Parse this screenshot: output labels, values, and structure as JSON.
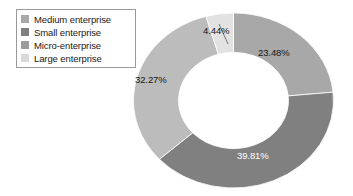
{
  "chart_data": {
    "type": "pie",
    "variant": "donut",
    "title": "",
    "subtitle": "",
    "xlabel": "",
    "ylabel": "",
    "grid": false,
    "legend_position": "top-left",
    "units": "percent",
    "start_angle_deg": 0,
    "direction": "clockwise",
    "inner_radius_ratio": 0.55,
    "categories": [
      "Medium enterprise",
      "Small enterprise",
      "Micro-enterprise",
      "Large enterprise"
    ],
    "values": [
      23.48,
      39.81,
      32.27,
      4.44
    ],
    "labels": [
      "23.48%",
      "39.81%",
      "32.27%",
      "4.44%"
    ],
    "colors": [
      "#a8a8a8",
      "#808080",
      "#bcbcbc",
      "#e2e2e2"
    ],
    "slices": [
      {
        "name": "Medium enterprise",
        "value": 23.48,
        "label": "23.48%",
        "color": "#a8a8a8",
        "label_color": "dark",
        "label_placement": "outside-right"
      },
      {
        "name": "Small enterprise",
        "value": 39.81,
        "label": "39.81%",
        "color": "#808080",
        "label_color": "light",
        "label_placement": "inside-bottom"
      },
      {
        "name": "Micro-enterprise",
        "value": 32.27,
        "label": "32.27%",
        "color": "#bcbcbc",
        "label_color": "dark",
        "label_placement": "inside-left"
      },
      {
        "name": "Large enterprise",
        "value": 4.44,
        "label": "4.44%",
        "color": "#e2e2e2",
        "label_color": "dark",
        "label_placement": "outside-top-leader-line"
      }
    ]
  },
  "legend": {
    "items": [
      {
        "label": "Medium enterprise",
        "color": "#a8a8a8"
      },
      {
        "label": "Small enterprise",
        "color": "#808080"
      },
      {
        "label": "Micro-enterprise",
        "color": "#9c9c9c"
      },
      {
        "label": "Large enterprise",
        "color": "#d9d9d9"
      }
    ]
  },
  "value_labels": {
    "medium": "23.48%",
    "small": "39.81%",
    "micro": "32.27%",
    "large": "4.44%"
  }
}
